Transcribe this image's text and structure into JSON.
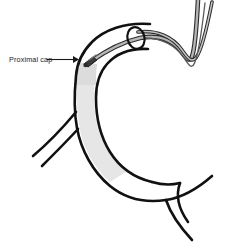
{
  "figure": {
    "width": 241,
    "height": 251,
    "background_color": "#ffffff"
  },
  "colors": {
    "vessel_outline": "#111111",
    "occlusion_fill": "#e6e6e6",
    "occlusion_fill_dark": "#dcdcdc",
    "catheter_outline": "#2b2b2b",
    "catheter_fill": "#b5b5b5",
    "device_tip": "#3a3a3a",
    "label_text": "#1a1a1a",
    "arrow": "#1a1a1a",
    "page_background": "#ffffff"
  },
  "annotations": [
    {
      "id": "proximal-cap",
      "label": "Proximal cap",
      "text_x": 9,
      "text_y": 62,
      "arrow_start_x": 47,
      "arrow_start_y": 60,
      "arrow_end_x": 77,
      "arrow_end_y": 60
    }
  ],
  "elements": {
    "vessel_name": "vessel-outline",
    "occlusion_name": "occlusion-shaded-segment",
    "catheter_name": "catheter-shaft",
    "guidewire_name": "guidewire",
    "device_tip_name": "device-tip",
    "ring_name": "catheter-entry-ring",
    "branch_left_name": "branch-vessel-left",
    "branch_right_name": "branch-vessel-right"
  }
}
